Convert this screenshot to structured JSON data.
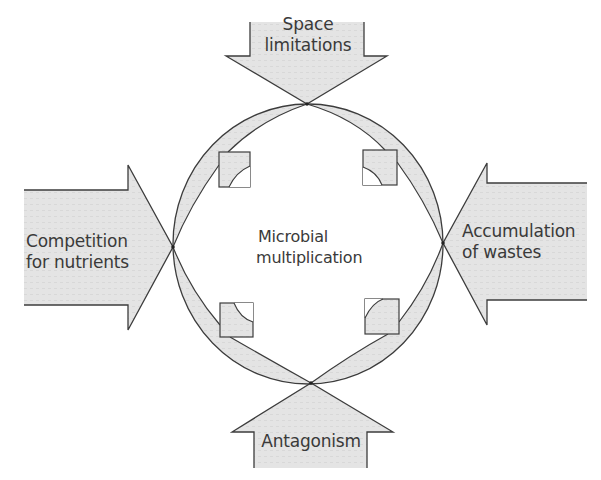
{
  "diagram": {
    "center_label": [
      "Microbial",
      "multiplication"
    ],
    "arrows": {
      "top": [
        "Space",
        "limitations"
      ],
      "left": [
        "Competition",
        "for nutrients"
      ],
      "right": [
        "Accumulation",
        "of wastes"
      ],
      "bottom": [
        "Antagonism"
      ]
    },
    "colors": {
      "fill": "#e3e3e3",
      "stroke": "#3c3c3c",
      "text": "#3a3a3a"
    }
  }
}
